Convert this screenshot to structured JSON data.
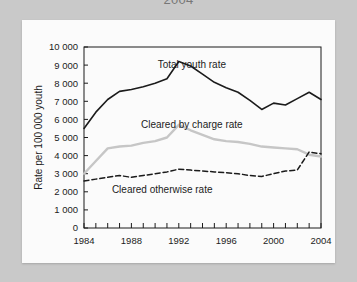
{
  "page": {
    "partial_title": "2004",
    "background_color": "#c9c9c9",
    "card_color": "#fbfbfb"
  },
  "chart_data": {
    "type": "line",
    "title": "",
    "xlabel": "",
    "ylabel": "Rate per 100 000 youth",
    "xlim": [
      1984,
      2004
    ],
    "ylim": [
      0,
      10000
    ],
    "grid": false,
    "legend": "inline-labels",
    "x": [
      1984,
      1985,
      1986,
      1987,
      1988,
      1989,
      1990,
      1991,
      1992,
      1993,
      1994,
      1995,
      1996,
      1997,
      1998,
      1999,
      2000,
      2001,
      2002,
      2003,
      2004
    ],
    "xticks": [
      1984,
      1988,
      1992,
      1996,
      2000,
      2004
    ],
    "xtick_labels": [
      "1984",
      "1988",
      "1992",
      "1996",
      "2000",
      "2004"
    ],
    "yticks": [
      0,
      1000,
      2000,
      3000,
      4000,
      5000,
      6000,
      7000,
      8000,
      9000,
      10000
    ],
    "ytick_labels": [
      "0",
      "1 000",
      "2 000",
      "3 000",
      "4 000",
      "5 000",
      "6 000",
      "7 000",
      "8 000",
      "9 000",
      "10 000"
    ],
    "series": [
      {
        "name": "Total youth rate",
        "color": "#1b1b1b",
        "style": "solid",
        "label_x": 1993.1,
        "label_y": 8850,
        "values": [
          5500,
          6400,
          7100,
          7550,
          7650,
          7800,
          8000,
          8250,
          9200,
          8950,
          8500,
          8050,
          7750,
          7500,
          7050,
          6550,
          6900,
          6800,
          7150,
          7500,
          7100
        ]
      },
      {
        "name": "Cleared by charge rate",
        "color": "#c6c6c6",
        "style": "solid",
        "label_x": 1993.1,
        "label_y": 5500,
        "values": [
          3000,
          3700,
          4400,
          4500,
          4550,
          4700,
          4800,
          5000,
          5700,
          5400,
          5150,
          4900,
          4800,
          4750,
          4650,
          4500,
          4450,
          4400,
          4350,
          4050,
          3950
        ]
      },
      {
        "name": "Cleared otherwise rate",
        "color": "#1b1b1b",
        "style": "dashed",
        "label_x": 1990.6,
        "label_y": 1950,
        "values": [
          2600,
          2700,
          2800,
          2900,
          2800,
          2900,
          3000,
          3100,
          3250,
          3200,
          3150,
          3100,
          3050,
          3000,
          2900,
          2850,
          3000,
          3150,
          3200,
          4200,
          4100
        ]
      }
    ]
  }
}
